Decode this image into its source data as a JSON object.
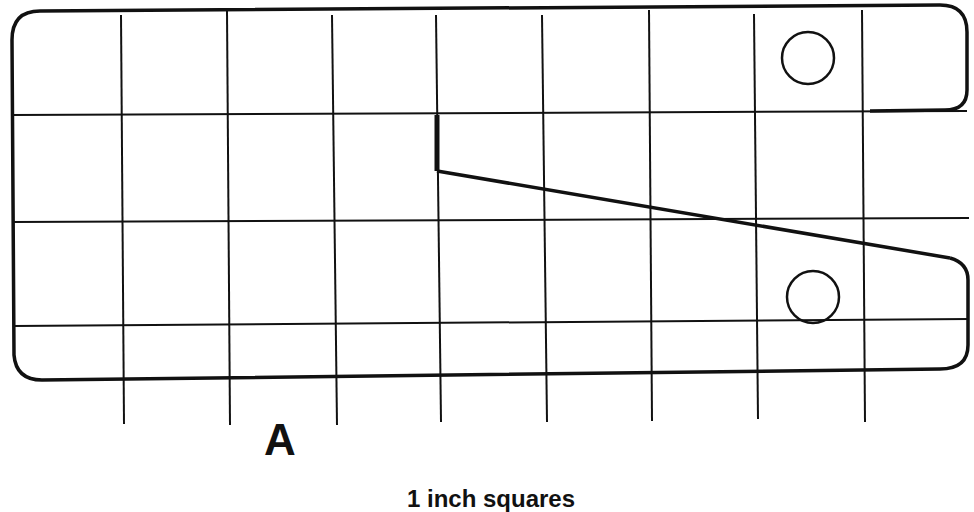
{
  "diagram": {
    "piece_label": "A",
    "caption": "1 inch squares",
    "grid": {
      "vertical_lines_x": [
        121,
        228,
        333,
        437,
        543,
        650,
        755,
        863
      ],
      "horizontal_lines_y": [
        115,
        222,
        327
      ],
      "unit": "1 inch"
    },
    "colors": {
      "line": "#111111",
      "background": "#ffffff"
    },
    "holes": [
      {
        "name": "upper-hole",
        "cx": 808,
        "cy": 58,
        "r": 26
      },
      {
        "name": "lower-hole",
        "cx": 813,
        "cy": 296,
        "r": 26
      }
    ]
  }
}
